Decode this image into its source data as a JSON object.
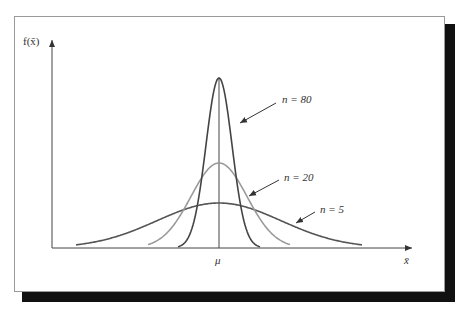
{
  "chart_data": {
    "type": "line",
    "title": "",
    "xlabel": "x̄",
    "ylabel": "f(x̄)",
    "x_tick_labels": [
      "μ"
    ],
    "grid": false,
    "legend": "annotations",
    "series": [
      {
        "name": "n = 80",
        "relative_peak_height": 1.0,
        "relative_spread": 0.18,
        "color": "#444444"
      },
      {
        "name": "n = 20",
        "relative_peak_height": 0.5,
        "relative_spread": 0.36,
        "color": "#9a9a9a"
      },
      {
        "name": "n = 5",
        "relative_peak_height": 0.26,
        "relative_spread": 0.8,
        "color": "#555555"
      }
    ]
  },
  "labels": {
    "y_axis": "f(x̄)",
    "x_axis": "x̄",
    "mu": "μ",
    "n80": "n = 80",
    "n20": "n = 20",
    "n5": "n = 5"
  },
  "colors": {
    "axis": "#444444",
    "n80": "#444444",
    "n20": "#9a9a9a",
    "n5": "#555555",
    "shadow": "#111111",
    "frame_border": "#9a9a9a"
  }
}
